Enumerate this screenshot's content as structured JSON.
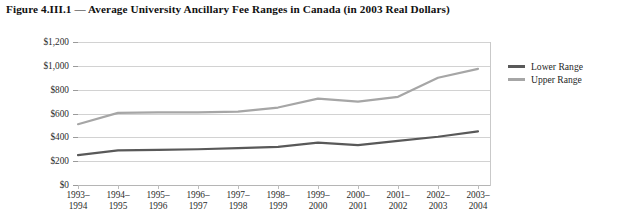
{
  "figure": {
    "title": "Figure 4.III.1 — Average University Ancillary Fee Ranges in Canada (in 2003 Real Dollars)"
  },
  "legend": {
    "position": "right",
    "entries": [
      {
        "label": "Lower Range",
        "color": "#595959"
      },
      {
        "label": "Upper Range",
        "color": "#a6a6a6"
      }
    ]
  },
  "axes": {
    "y_ticks": [
      "$1,200",
      "$1,000",
      "$800",
      "$600",
      "$400",
      "$200",
      "$0"
    ],
    "x_ticks": [
      {
        "line1": "1993–",
        "line2": "1994"
      },
      {
        "line1": "1994–",
        "line2": "1995"
      },
      {
        "line1": "1995–",
        "line2": "1996"
      },
      {
        "line1": "1996–",
        "line2": "1997"
      },
      {
        "line1": "1997–",
        "line2": "1998"
      },
      {
        "line1": "1998–",
        "line2": "1999"
      },
      {
        "line1": "1999–",
        "line2": "2000"
      },
      {
        "line1": "2000–",
        "line2": "2001"
      },
      {
        "line1": "2001–",
        "line2": "2002"
      },
      {
        "line1": "2002–",
        "line2": "2003"
      },
      {
        "line1": "2003–",
        "line2": "2004"
      }
    ]
  },
  "chart_data": {
    "type": "line",
    "title": "Figure 4.III.1 — Average University Ancillary Fee Ranges in Canada (in 2003 Real Dollars)",
    "xlabel": "",
    "ylabel": "",
    "ylim": [
      0,
      1200
    ],
    "ytick_values": [
      0,
      200,
      400,
      600,
      800,
      1000,
      1200
    ],
    "grid": true,
    "legend_position": "right",
    "categories": [
      "1993–1994",
      "1994–1995",
      "1995–1996",
      "1996–1997",
      "1997–1998",
      "1998–1999",
      "1999–2000",
      "2000–2001",
      "2001–2002",
      "2002–2003",
      "2003–2004"
    ],
    "series": [
      {
        "name": "Lower Range",
        "color": "#595959",
        "values": [
          250,
          290,
          295,
          300,
          310,
          320,
          355,
          335,
          370,
          405,
          450
        ]
      },
      {
        "name": "Upper Range",
        "color": "#a6a6a6",
        "values": [
          510,
          605,
          610,
          610,
          615,
          650,
          725,
          700,
          740,
          900,
          975
        ]
      }
    ]
  }
}
